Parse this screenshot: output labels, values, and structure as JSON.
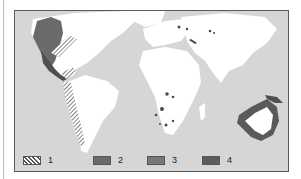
{
  "figure": {
    "type": "world-map",
    "background_color": "#d6d6d6",
    "land_unshaded_color": "#ffffff",
    "frame_color": "#5a5a5a"
  },
  "regions": [
    {
      "area": "western North America (Pacific coast, California, Baja)",
      "legend_class": "2"
    },
    {
      "area": "Mexico and Central America",
      "legend_class": "4"
    },
    {
      "area": "Atlantic coast of North America / Caribbean islands",
      "legend_class": "1"
    },
    {
      "area": "Andean western coast of South America",
      "legend_class": "1"
    },
    {
      "area": "southern Africa (scattered spots)",
      "legend_class": "4"
    },
    {
      "area": "central Asia (scattered spots)",
      "legend_class": "4"
    },
    {
      "area": "Australia coastal ring",
      "legend_class": "3"
    },
    {
      "area": "New Guinea",
      "legend_class": "4"
    }
  ],
  "legend": {
    "items": [
      {
        "label": "1",
        "pattern": "hatched",
        "color": "#8a8a8a"
      },
      {
        "label": "2",
        "pattern": "solid",
        "color": "#6a6a6a"
      },
      {
        "label": "3",
        "pattern": "solid",
        "color": "#777777"
      },
      {
        "label": "4",
        "pattern": "solid-dark",
        "color": "#5c5c5c"
      }
    ]
  }
}
